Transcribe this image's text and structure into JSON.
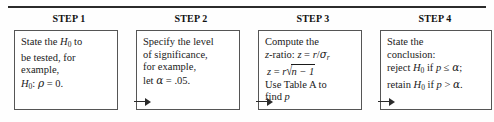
{
  "figure": {
    "rule_color": "#2b2b2b",
    "box_border_color": "#555555",
    "background": "#ffffff"
  },
  "headers": [
    {
      "label": "STEP 1"
    },
    {
      "label": "STEP 2"
    },
    {
      "label": "STEP 3"
    },
    {
      "label": "STEP 4"
    }
  ],
  "boxes": [
    {
      "id": "step-1",
      "lines": [
        "State the H0 to",
        "be tested, for",
        "example,",
        "H0: ρ = 0."
      ]
    },
    {
      "id": "step-2",
      "lines": [
        "Specify the level",
        "of significance,",
        "for example,",
        "let α = .05."
      ]
    },
    {
      "id": "step-3",
      "lines": [
        "Compute the",
        "z-ratio: z = r/σr",
        "z = r√(n − 1)",
        "Use Table A to",
        "find p"
      ]
    },
    {
      "id": "step-4",
      "lines": [
        "State the",
        "conclusion:",
        "reject H0 if p ≤ α;",
        "retain H0 if p > α."
      ]
    }
  ],
  "text": {
    "b1_l1_a": "State the ",
    "b1_l1_H": "H",
    "b1_l1_sub": "0",
    "b1_l1_b": " to",
    "b1_l2": "be tested, for",
    "b1_l3": "example,",
    "b1_l4_H": "H",
    "b1_l4_sub": "0",
    "b1_l4_colon": ": ",
    "b1_l4_rho": "ρ",
    "b1_l4_eq": " = 0.",
    "b2_l1": "Specify the level",
    "b2_l2": "of significance,",
    "b2_l3": "for example,",
    "b2_l4_let": "let ",
    "b2_l4_alpha": "α",
    "b2_l4_eq": " = .05.",
    "b3_l1": "Compute the",
    "b3_l2_z": "z",
    "b3_l2_ratio": "-ratio: ",
    "b3_l2_z2": "z",
    "b3_l2_eq": " = ",
    "b3_l2_r": "r",
    "b3_l2_slash": "/",
    "b3_l2_sigma": "σ",
    "b3_l2_sub": "r",
    "b3_l3_z": "z",
    "b3_l3_eq": " = ",
    "b3_l3_r": "r",
    "b3_l3_radical": "√",
    "b3_l3_under": "n − 1",
    "b3_l4": "Use Table A to",
    "b3_l5_find": "find ",
    "b3_l5_p": "p",
    "b4_l1": "State the",
    "b4_l2": "conclusion:",
    "b4_l3_a": "reject ",
    "b4_l3_H": "H",
    "b4_l3_sub": "0",
    "b4_l3_if": " if ",
    "b4_l3_p": "p",
    "b4_l3_op": " ≤ ",
    "b4_l3_alpha": "α",
    "b4_l3_end": ";",
    "b4_l4_a": "retain ",
    "b4_l4_H": "H",
    "b4_l4_sub": "0",
    "b4_l4_if": " if ",
    "b4_l4_p": "p",
    "b4_l4_op": " > ",
    "b4_l4_alpha": "α",
    "b4_l4_end": "."
  }
}
